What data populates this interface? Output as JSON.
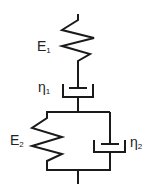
{
  "diagram": {
    "type": "rheological-model",
    "stroke_color": "#1a1a1a",
    "components": [
      {
        "id": "spring-1",
        "kind": "spring",
        "label": "E",
        "subscript": "1"
      },
      {
        "id": "dashpot-1",
        "kind": "dashpot",
        "label": "η",
        "subscript": "1"
      },
      {
        "id": "spring-2",
        "kind": "spring",
        "label": "E",
        "subscript": "2"
      },
      {
        "id": "dashpot-2",
        "kind": "dashpot",
        "label": "η",
        "subscript": "2"
      }
    ],
    "connections": "spring-1 in series with dashpot-1, in series with (spring-2 parallel dashpot-2)"
  }
}
